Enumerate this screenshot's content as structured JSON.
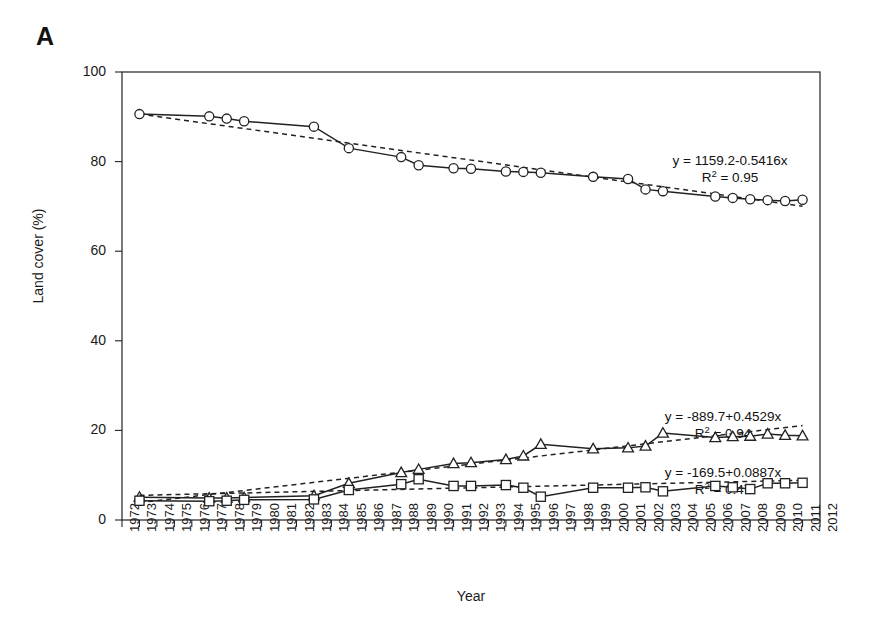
{
  "figure": {
    "panel_label": "A",
    "background": "#ffffff",
    "ink_color": "#222222"
  },
  "chart_data": {
    "type": "line",
    "title": "",
    "xlabel": "Year",
    "ylabel": "Land cover (%)",
    "xlim": [
      1972,
      2012
    ],
    "ylim": [
      0,
      100
    ],
    "yticks": [
      0,
      20,
      40,
      60,
      80,
      100
    ],
    "grid": false,
    "legend_position": "none",
    "xticks": [
      "1972",
      "1973",
      "1974",
      "1975",
      "1976",
      "1977",
      "1978",
      "1979",
      "1980",
      "1981",
      "1982",
      "1983",
      "1984",
      "1985",
      "1986",
      "1987",
      "1988",
      "1989",
      "1990",
      "1991",
      "1992",
      "1993",
      "1994",
      "1995",
      "1996",
      "1997",
      "1998",
      "1999",
      "2000",
      "2001",
      "2002",
      "2003",
      "2004",
      "2005",
      "2006",
      "2007",
      "2008",
      "2009",
      "2010",
      "2011",
      "2012"
    ],
    "series": [
      {
        "name": "series-circle",
        "marker": "circle",
        "linestyle": "solid",
        "x": [
          1973,
          1977,
          1978,
          1979,
          1983,
          1985,
          1988,
          1989,
          1991,
          1992,
          1994,
          1995,
          1996,
          1999,
          2001,
          2002,
          2003,
          2006,
          2007,
          2008,
          2009,
          2010,
          2011
        ],
        "values": [
          90.6,
          90.1,
          89.6,
          89.0,
          87.8,
          83.0,
          81.0,
          79.2,
          78.5,
          78.4,
          77.8,
          77.7,
          77.5,
          76.6,
          76.1,
          73.8,
          73.4,
          72.2,
          71.9,
          71.6,
          71.4,
          71.2,
          71.5
        ],
        "trend": {
          "equation": "y = 1159.2-0.5416x",
          "r2_label": "R² = 0.95",
          "slope": -0.5416,
          "intercept": 1159.2,
          "r2": 0.95,
          "linestyle": "dashed"
        }
      },
      {
        "name": "series-triangle",
        "marker": "triangle",
        "linestyle": "solid",
        "x": [
          1973,
          1977,
          1978,
          1979,
          1983,
          1985,
          1988,
          1989,
          1991,
          1992,
          1994,
          1995,
          1996,
          1999,
          2001,
          2002,
          2003,
          2006,
          2007,
          2008,
          2009,
          2010,
          2011
        ],
        "values": [
          5.1,
          4.9,
          4.9,
          5.0,
          5.4,
          8.2,
          10.6,
          11.3,
          12.6,
          12.8,
          13.5,
          14.3,
          16.9,
          15.9,
          16.1,
          16.5,
          19.4,
          18.4,
          18.6,
          18.7,
          19.2,
          18.9,
          18.8
        ],
        "trend": {
          "equation": "y = -889.7+0.4529x",
          "r2_label": "R² = 0.94",
          "slope": 0.4529,
          "intercept": -889.7,
          "r2": 0.94,
          "linestyle": "dashed"
        }
      },
      {
        "name": "series-square",
        "marker": "square",
        "linestyle": "solid",
        "x": [
          1973,
          1977,
          1978,
          1979,
          1983,
          1985,
          1988,
          1989,
          1991,
          1992,
          1994,
          1995,
          1996,
          1999,
          2001,
          2002,
          2003,
          2006,
          2007,
          2008,
          2009,
          2010,
          2011
        ],
        "values": [
          4.3,
          4.2,
          4.3,
          4.5,
          4.6,
          6.7,
          8.0,
          9.1,
          7.6,
          7.6,
          7.8,
          7.2,
          5.2,
          7.2,
          7.2,
          7.3,
          6.4,
          7.6,
          7.3,
          6.9,
          8.2,
          8.2,
          8.3
        ],
        "trend": {
          "equation": "y = -169.5+0.0887x",
          "r2_label": "R² = 0.47",
          "slope": 0.0887,
          "intercept": -169.5,
          "r2": 0.47,
          "linestyle": "dashed"
        }
      }
    ],
    "annotations": [
      {
        "id": "annot-circle",
        "equation": "y = 1159.2-0.5416x",
        "r2": "R² = 0.95",
        "x": 730,
        "y": 152
      },
      {
        "id": "annot-triangle",
        "equation": "y = -889.7+0.4529x",
        "r2": "R² = 0.94",
        "x": 723,
        "y": 408
      },
      {
        "id": "annot-square",
        "equation": "y = -169.5+0.0887x",
        "r2": "R² = 0.47",
        "x": 723,
        "y": 464
      }
    ]
  }
}
